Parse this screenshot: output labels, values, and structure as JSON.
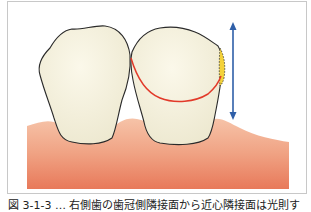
{
  "figure": {
    "caption": "図 3-1-3 … 右側歯の歯冠側隣接面から近心隣接面は光則す",
    "illustration": {
      "subject": "two-teeth-with-gingiva",
      "elements": [
        "left-tooth-crown",
        "right-tooth-crown",
        "gingiva",
        "red-contour-line",
        "yellow-dotted-area",
        "blue-double-arrow"
      ],
      "colors": {
        "tooth_fill": "#f3efdc",
        "tooth_outline": "#2a2a2a",
        "gingiva_top": "#f4b59a",
        "gingiva_bottom": "#e97d5e",
        "red_line": "#e23a2a",
        "yellow_area": "#f4d23a",
        "arrow": "#2f5fa8",
        "frame_border": "#c8c8c8"
      }
    }
  }
}
